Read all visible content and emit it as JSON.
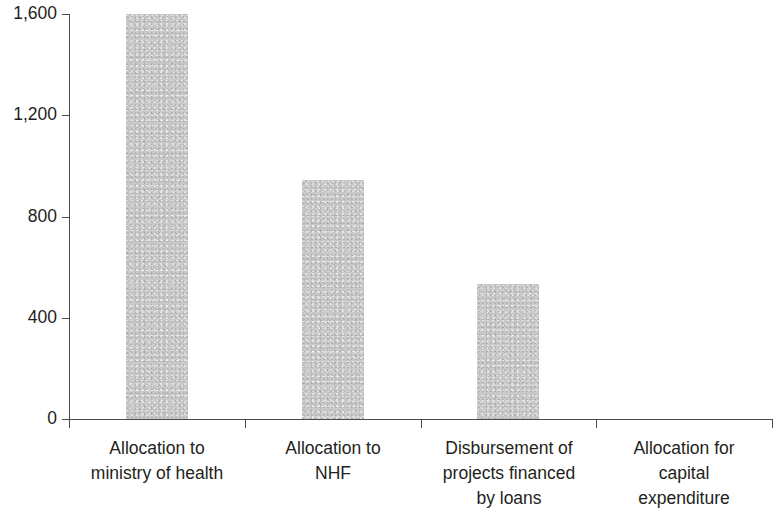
{
  "chart_data": {
    "type": "bar",
    "title": "",
    "subtitle": "",
    "xlabel": "",
    "ylabel": "",
    "categories": [
      "Allocation to ministry of health",
      "Allocation to NHF",
      "Disbursement of projects financed by loans",
      "Allocation for capital expenditure"
    ],
    "category_lines": [
      [
        "Allocation to",
        "ministry of health"
      ],
      [
        "Allocation to",
        "NHF"
      ],
      [
        "Disbursement of",
        "projects financed",
        "by loans"
      ],
      [
        "Allocation for",
        "capital",
        "expenditure"
      ]
    ],
    "values": [
      1600,
      944,
      533,
      0
    ],
    "series": [
      {
        "name": "",
        "values": [
          1600,
          944,
          533,
          0
        ]
      }
    ],
    "ylim": [
      0,
      1600
    ],
    "yticks": [
      0,
      400,
      800,
      1200,
      1600
    ],
    "ytick_labels": [
      "0",
      "400",
      "800",
      "1,200",
      "1,600"
    ],
    "grid": false,
    "legend": false,
    "legend_position": "none",
    "bar_color": "#c9c9c9",
    "axis_color": "#4a4a4a",
    "text_color": "#231f20",
    "background_color": "#ffffff",
    "annotations": []
  }
}
